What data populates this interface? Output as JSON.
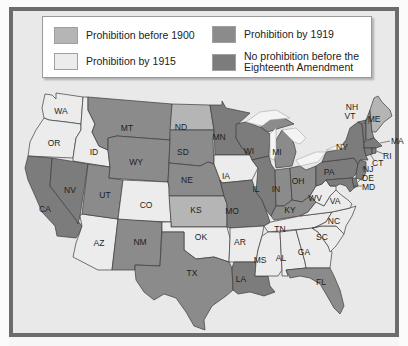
{
  "legend": {
    "items": [
      {
        "key": "before_1900",
        "label": "Prohibition before 1900",
        "color": "#b5b5b5"
      },
      {
        "key": "by_1915",
        "label": "Prohibition by 1915",
        "color": "#ececec"
      },
      {
        "key": "by_1919",
        "label": "Prohibition by 1919",
        "color": "#8b8b8b"
      },
      {
        "key": "none",
        "label_line1": "No prohibition before the",
        "label_line2": "Eighteenth Amendment",
        "color": "#7c7c7c"
      }
    ]
  },
  "colors": {
    "frame": "#6c6c6c",
    "background": "#e9e9e9",
    "lakes": "#f4f4f4"
  },
  "states": {
    "WA": {
      "label": "WA",
      "category": "by_1915"
    },
    "OR": {
      "label": "OR",
      "category": "by_1915"
    },
    "CA": {
      "label": "CA",
      "category": "none"
    },
    "ID": {
      "label": "ID",
      "category": "by_1915"
    },
    "NV": {
      "label": "NV",
      "category": "none"
    },
    "AZ": {
      "label": "AZ",
      "category": "by_1915"
    },
    "UT": {
      "label": "UT",
      "category": "by_1919"
    },
    "MT": {
      "label": "MT",
      "category": "by_1919"
    },
    "WY": {
      "label": "WY",
      "category": "by_1919"
    },
    "CO": {
      "label": "CO",
      "category": "by_1915"
    },
    "NM": {
      "label": "NM",
      "category": "by_1919"
    },
    "ND": {
      "label": "ND",
      "category": "before_1900"
    },
    "SD": {
      "label": "SD",
      "category": "by_1919"
    },
    "NE": {
      "label": "NE",
      "category": "by_1919"
    },
    "KS": {
      "label": "KS",
      "category": "before_1900"
    },
    "OK": {
      "label": "OK",
      "category": "by_1915"
    },
    "TX": {
      "label": "TX",
      "category": "by_1919"
    },
    "MN": {
      "label": "MN",
      "category": "none"
    },
    "IA": {
      "label": "IA",
      "category": "by_1915"
    },
    "MO": {
      "label": "MO",
      "category": "none"
    },
    "AR": {
      "label": "AR",
      "category": "by_1915"
    },
    "LA": {
      "label": "LA",
      "category": "none"
    },
    "WI": {
      "label": "WI",
      "category": "none"
    },
    "IL": {
      "label": "IL",
      "category": "none"
    },
    "MI": {
      "label": "MI",
      "category": "by_1919"
    },
    "IN": {
      "label": "IN",
      "category": "by_1919"
    },
    "OH": {
      "label": "OH",
      "category": "by_1919"
    },
    "KY": {
      "label": "KY",
      "category": "by_1919"
    },
    "TN": {
      "label": "TN",
      "category": "by_1915"
    },
    "MS": {
      "label": "MS",
      "category": "by_1915"
    },
    "AL": {
      "label": "AL",
      "category": "by_1915"
    },
    "GA": {
      "label": "GA",
      "category": "by_1915"
    },
    "FL": {
      "label": "FL",
      "category": "by_1919"
    },
    "SC": {
      "label": "SC",
      "category": "by_1915"
    },
    "NC": {
      "label": "NC",
      "category": "by_1915"
    },
    "VA": {
      "label": "VA",
      "category": "by_1915"
    },
    "WV": {
      "label": "WV",
      "category": "by_1915"
    },
    "PA": {
      "label": "PA",
      "category": "none"
    },
    "NY": {
      "label": "NY",
      "category": "none"
    },
    "VT": {
      "label": "VT",
      "category": "none"
    },
    "NH": {
      "label": "NH",
      "category": "by_1919"
    },
    "ME": {
      "label": "ME",
      "category": "before_1900"
    },
    "MA": {
      "label": "MA",
      "category": "none"
    },
    "RI": {
      "label": "RI",
      "category": "none"
    },
    "CT": {
      "label": "CT",
      "category": "none"
    },
    "NJ": {
      "label": "NJ",
      "category": "none"
    },
    "DE": {
      "label": "DE",
      "category": "none"
    },
    "MD": {
      "label": "MD",
      "category": "none"
    }
  }
}
